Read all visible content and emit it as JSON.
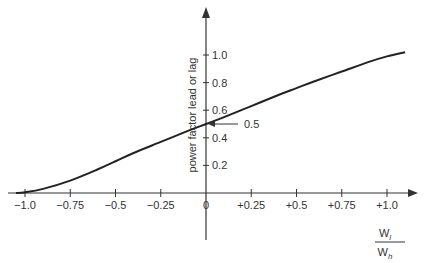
{
  "chart_data": {
    "type": "line",
    "title": "",
    "xlabel": "W_l / W_h",
    "xlabel_numerator": "W",
    "xlabel_numerator_sub": "l",
    "xlabel_denominator": "W",
    "xlabel_denominator_sub": "h",
    "ylabel": "power factor lead or lag",
    "xlim": [
      -1.1,
      1.2
    ],
    "ylim": [
      0,
      1.15
    ],
    "grid": false,
    "legend": null,
    "x_ticks": [
      -1.0,
      -0.75,
      -0.5,
      -0.25,
      0,
      0.25,
      0.5,
      0.75,
      1.0
    ],
    "x_tick_labels": [
      "−1.0",
      "−0.75",
      "−0.5",
      "−0.25",
      "0",
      "+0.25",
      "+0.5",
      "+0.75",
      "+1.0"
    ],
    "y_ticks": [
      0.2,
      0.4,
      0.6,
      0.8,
      1.0
    ],
    "y_tick_labels": [
      "0.2",
      "0.4",
      "0.6",
      "0.8",
      "1.0"
    ],
    "annotations": [
      {
        "text": "0.5",
        "x": 0,
        "y": 0.5,
        "arrow": "left-pointing to y-axis at 0.5"
      }
    ],
    "series": [
      {
        "name": "power factor",
        "x": [
          -1.05,
          -1.0,
          -0.9,
          -0.75,
          -0.6,
          -0.5,
          -0.4,
          -0.25,
          -0.1,
          0,
          0.1,
          0.25,
          0.4,
          0.5,
          0.6,
          0.75,
          0.9,
          1.0,
          1.1
        ],
        "values": [
          0.0,
          0.005,
          0.03,
          0.09,
          0.17,
          0.23,
          0.29,
          0.37,
          0.45,
          0.5,
          0.55,
          0.63,
          0.71,
          0.76,
          0.81,
          0.88,
          0.95,
          0.99,
          1.02
        ]
      }
    ]
  }
}
